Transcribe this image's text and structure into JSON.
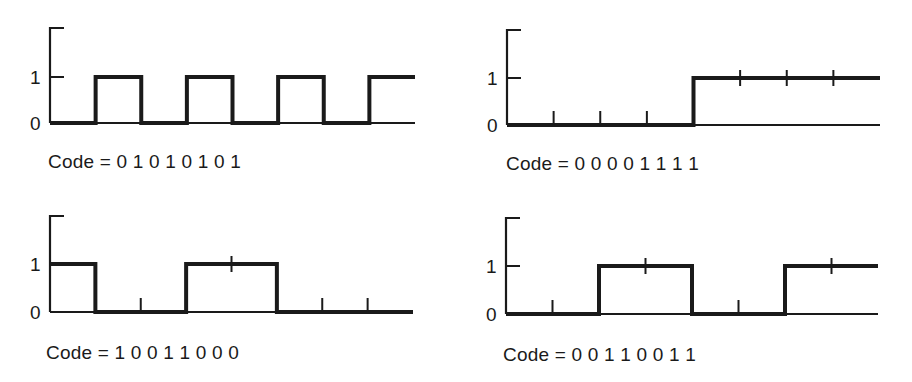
{
  "colors": {
    "ink": "#1a1a1a",
    "background": "#ffffff"
  },
  "chart_data": [
    {
      "type": "line",
      "title": "Code = 0 1 0 1 0 1 0 1",
      "code_label": "Code = ",
      "code_bits": "0 1 0 1 0 1 0 1",
      "bits": [
        0,
        1,
        0,
        1,
        0,
        1,
        0,
        1
      ],
      "y_ticks": [
        "0",
        "1"
      ],
      "ylim": [
        0,
        1
      ]
    },
    {
      "type": "line",
      "title": "Code = 0 0 0 0 1 1 1 1",
      "code_label": "Code = ",
      "code_bits": "0 0 0 0 1 1 1 1",
      "bits": [
        0,
        0,
        0,
        0,
        1,
        1,
        1,
        1
      ],
      "y_ticks": [
        "0",
        "1"
      ],
      "ylim": [
        0,
        1
      ]
    },
    {
      "type": "line",
      "title": "Code = 1 0 0 1 1 0 0 0",
      "code_label": "Code = ",
      "code_bits": "1 0 0 1 1 0 0 0",
      "bits": [
        1,
        0,
        0,
        1,
        1,
        0,
        0,
        0
      ],
      "y_ticks": [
        "0",
        "1"
      ],
      "ylim": [
        0,
        1
      ]
    },
    {
      "type": "line",
      "title": "Code = 0 0 1 1 0 0 1 1",
      "code_label": "Code = ",
      "code_bits": "0 0 1 1 0 0 1 1",
      "bits": [
        0,
        0,
        1,
        1,
        0,
        0,
        1,
        1
      ],
      "y_ticks": [
        "0",
        "1"
      ],
      "ylim": [
        0,
        1
      ]
    }
  ],
  "panels": [
    {
      "label": "Code = 0 1 0 1 0 1 0 1",
      "y_one": "1",
      "y_zero": "0"
    },
    {
      "label": "Code = 0 0 0 0 1 1 1 1",
      "y_one": "1",
      "y_zero": "0"
    },
    {
      "label": "Code = 1 0 0 1 1 0 0 0",
      "y_one": "1",
      "y_zero": "0"
    },
    {
      "label": "Code = 0 0 1 1 0 0 1 1",
      "y_one": "1",
      "y_zero": "0"
    }
  ]
}
